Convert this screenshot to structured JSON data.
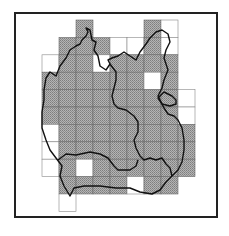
{
  "map": {
    "type": "grid distribution map",
    "frame": {
      "x": 15,
      "y": 13,
      "width": 202,
      "height": 204,
      "stroke": "#222222",
      "stroke_width": 2
    },
    "grid": {
      "origin_x": 42,
      "origin_y": 20,
      "cell_w": 17,
      "cell_h": 17.4
    },
    "colors": {
      "present": "#a8a8a8",
      "hatch": "#8a8a8a",
      "absent": "#ffffff",
      "grid_line": "#555555",
      "boundary": "#111111"
    },
    "legend": {
      "present": "shaded square = recorded",
      "absent": "open square = surveyed, not recorded"
    },
    "cells": [
      {
        "r": 0,
        "c": 2,
        "s": 1
      },
      {
        "r": 0,
        "c": 6,
        "s": 1
      },
      {
        "r": 0,
        "c": 7,
        "s": 0
      },
      {
        "r": 1,
        "c": 1,
        "s": 1
      },
      {
        "r": 1,
        "c": 2,
        "s": 1
      },
      {
        "r": 1,
        "c": 3,
        "s": 1
      },
      {
        "r": 1,
        "c": 4,
        "s": 0
      },
      {
        "r": 1,
        "c": 5,
        "s": 0
      },
      {
        "r": 1,
        "c": 6,
        "s": 1
      },
      {
        "r": 1,
        "c": 7,
        "s": 0
      },
      {
        "r": 2,
        "c": 0,
        "s": 0
      },
      {
        "r": 2,
        "c": 1,
        "s": 1
      },
      {
        "r": 2,
        "c": 2,
        "s": 1
      },
      {
        "r": 2,
        "c": 3,
        "s": 0
      },
      {
        "r": 2,
        "c": 4,
        "s": 1
      },
      {
        "r": 2,
        "c": 5,
        "s": 1
      },
      {
        "r": 2,
        "c": 6,
        "s": 1
      },
      {
        "r": 2,
        "c": 7,
        "s": 1
      },
      {
        "r": 3,
        "c": 0,
        "s": 1
      },
      {
        "r": 3,
        "c": 1,
        "s": 1
      },
      {
        "r": 3,
        "c": 2,
        "s": 1
      },
      {
        "r": 3,
        "c": 3,
        "s": 1
      },
      {
        "r": 3,
        "c": 4,
        "s": 1
      },
      {
        "r": 3,
        "c": 5,
        "s": 1
      },
      {
        "r": 3,
        "c": 6,
        "s": 0
      },
      {
        "r": 3,
        "c": 7,
        "s": 1
      },
      {
        "r": 4,
        "c": 0,
        "s": 1
      },
      {
        "r": 4,
        "c": 1,
        "s": 1
      },
      {
        "r": 4,
        "c": 2,
        "s": 1
      },
      {
        "r": 4,
        "c": 3,
        "s": 1
      },
      {
        "r": 4,
        "c": 4,
        "s": 1
      },
      {
        "r": 4,
        "c": 5,
        "s": 1
      },
      {
        "r": 4,
        "c": 6,
        "s": 1
      },
      {
        "r": 4,
        "c": 7,
        "s": 1
      },
      {
        "r": 4,
        "c": 8,
        "s": 0
      },
      {
        "r": 5,
        "c": 0,
        "s": 1
      },
      {
        "r": 5,
        "c": 1,
        "s": 1
      },
      {
        "r": 5,
        "c": 2,
        "s": 1
      },
      {
        "r": 5,
        "c": 3,
        "s": 1
      },
      {
        "r": 5,
        "c": 4,
        "s": 1
      },
      {
        "r": 5,
        "c": 5,
        "s": 1
      },
      {
        "r": 5,
        "c": 6,
        "s": 1
      },
      {
        "r": 5,
        "c": 7,
        "s": 1
      },
      {
        "r": 5,
        "c": 8,
        "s": 0
      },
      {
        "r": 6,
        "c": 0,
        "s": 0
      },
      {
        "r": 6,
        "c": 1,
        "s": 1
      },
      {
        "r": 6,
        "c": 2,
        "s": 1
      },
      {
        "r": 6,
        "c": 3,
        "s": 1
      },
      {
        "r": 6,
        "c": 4,
        "s": 1
      },
      {
        "r": 6,
        "c": 5,
        "s": 1
      },
      {
        "r": 6,
        "c": 6,
        "s": 1
      },
      {
        "r": 6,
        "c": 7,
        "s": 1
      },
      {
        "r": 6,
        "c": 8,
        "s": 1
      },
      {
        "r": 7,
        "c": 0,
        "s": 0
      },
      {
        "r": 7,
        "c": 1,
        "s": 1
      },
      {
        "r": 7,
        "c": 2,
        "s": 1
      },
      {
        "r": 7,
        "c": 3,
        "s": 1
      },
      {
        "r": 7,
        "c": 4,
        "s": 1
      },
      {
        "r": 7,
        "c": 5,
        "s": 1
      },
      {
        "r": 7,
        "c": 6,
        "s": 1
      },
      {
        "r": 7,
        "c": 7,
        "s": 1
      },
      {
        "r": 7,
        "c": 8,
        "s": 1
      },
      {
        "r": 8,
        "c": 0,
        "s": 0
      },
      {
        "r": 8,
        "c": 1,
        "s": 1
      },
      {
        "r": 8,
        "c": 2,
        "s": 0
      },
      {
        "r": 8,
        "c": 3,
        "s": 1
      },
      {
        "r": 8,
        "c": 4,
        "s": 1
      },
      {
        "r": 8,
        "c": 5,
        "s": 1
      },
      {
        "r": 8,
        "c": 6,
        "s": 1
      },
      {
        "r": 8,
        "c": 7,
        "s": 1
      },
      {
        "r": 8,
        "c": 8,
        "s": 1
      },
      {
        "r": 9,
        "c": 1,
        "s": 1
      },
      {
        "r": 9,
        "c": 2,
        "s": 1
      },
      {
        "r": 9,
        "c": 3,
        "s": 1
      },
      {
        "r": 9,
        "c": 4,
        "s": 1
      },
      {
        "r": 9,
        "c": 5,
        "s": 0
      },
      {
        "r": 9,
        "c": 6,
        "s": 1
      },
      {
        "r": 9,
        "c": 7,
        "s": 1
      },
      {
        "r": 10,
        "c": 1,
        "s": 0
      }
    ],
    "boundaries": [
      {
        "name": "outer-region",
        "d": "M46 78 L50 72 L56 76 L60 66 L66 58 L70 50 L76 46 L80 44 L82 40 L86 36 L88 32 L86 28 L90 30 L92 40 L96 42 L94 50 L98 56 L100 66 L106 70 L110 64 L108 60 L112 58 L118 56 L124 52 L130 56 L136 60 L140 52 L146 44 L150 38 L156 32 L162 30 L168 34 L170 42 L166 50 L164 58 L168 70 L164 80 L162 88 L158 96 L164 108 L168 114 L174 116 L178 120 L182 128 L184 140 L184 150 L182 162 L178 170 L172 176 L166 182 L160 190 L152 194 L140 192 L130 188 L116 188 L100 186 L84 186 L74 188 L70 196 L64 186 L60 176 L62 166 L56 158 L50 150 L46 140 L42 128 L42 112 L44 100 L44 90 Z"
      },
      {
        "name": "inner-divider-left",
        "d": "M110 64 L116 72 L116 80 L114 88 L112 96 L114 104 L118 108 L126 110 L134 116 L138 122 L138 132 L134 140 L136 148 L140 156 L144 160 L150 158 L156 160 L162 158 L166 164 L170 168 L172 176"
      },
      {
        "name": "inner-divider-south",
        "d": "M58 160 L66 154 L76 155 L90 152 L100 154 L108 158 L114 166 L118 170 L130 170 L136 166 L138 160"
      },
      {
        "name": "lake",
        "d": "M158 98 L164 92 L172 96 L176 100 L176 104 L170 106 L162 104 Z"
      }
    ]
  }
}
